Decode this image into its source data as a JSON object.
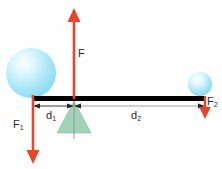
{
  "diagram": {
    "background_color": "#fefefe",
    "labels": {
      "effort_force": "F",
      "load_force_base": "F",
      "load_force_sub": "1",
      "resistance_force_base": "F",
      "resistance_force_sub": "2",
      "distance_left_base": "d",
      "distance_left_sub": "1",
      "distance_right_base": "d",
      "distance_right_sub": "2"
    },
    "colors": {
      "arrow_red": "#e8452a",
      "beam_black": "#000000",
      "fulcrum_green": "#8fcbab",
      "fulcrum_green_stroke": "#6fb797",
      "sphere_cyan": "#9fe4f4",
      "sphere_highlight": "#f2fdff",
      "dimension_gray": "#9a9a9a",
      "dimension_black": "#1a1a1a",
      "text_color": "#2b2b2b"
    },
    "elements": {
      "beam": {
        "x1": 33,
        "x2": 206,
        "y": 98,
        "thickness": 5
      },
      "fulcrum": {
        "apex_x": 74,
        "apex_y": 101,
        "base_y": 133,
        "half_width": 17
      },
      "effort_arrow": {
        "x": 74,
        "y_tip": 8,
        "y_base": 99,
        "direction": "up"
      },
      "load_arrow": {
        "x": 33,
        "y_tip": 164,
        "y_base": 96,
        "direction": "down"
      },
      "resistance_arrow": {
        "x": 205,
        "y_tip": 118,
        "y_base": 97,
        "direction": "down"
      },
      "left_sphere": {
        "cx": 31,
        "cy": 73,
        "r": 25
      },
      "right_sphere": {
        "cx": 200,
        "cy": 84,
        "r": 12
      },
      "dimension_d1": {
        "x1": 33,
        "x2": 74,
        "y": 106
      },
      "dimension_d2": {
        "x1": 74,
        "x2": 205,
        "y": 106
      },
      "center_post": {
        "x": 74,
        "y1": 99,
        "y2": 138
      }
    }
  }
}
